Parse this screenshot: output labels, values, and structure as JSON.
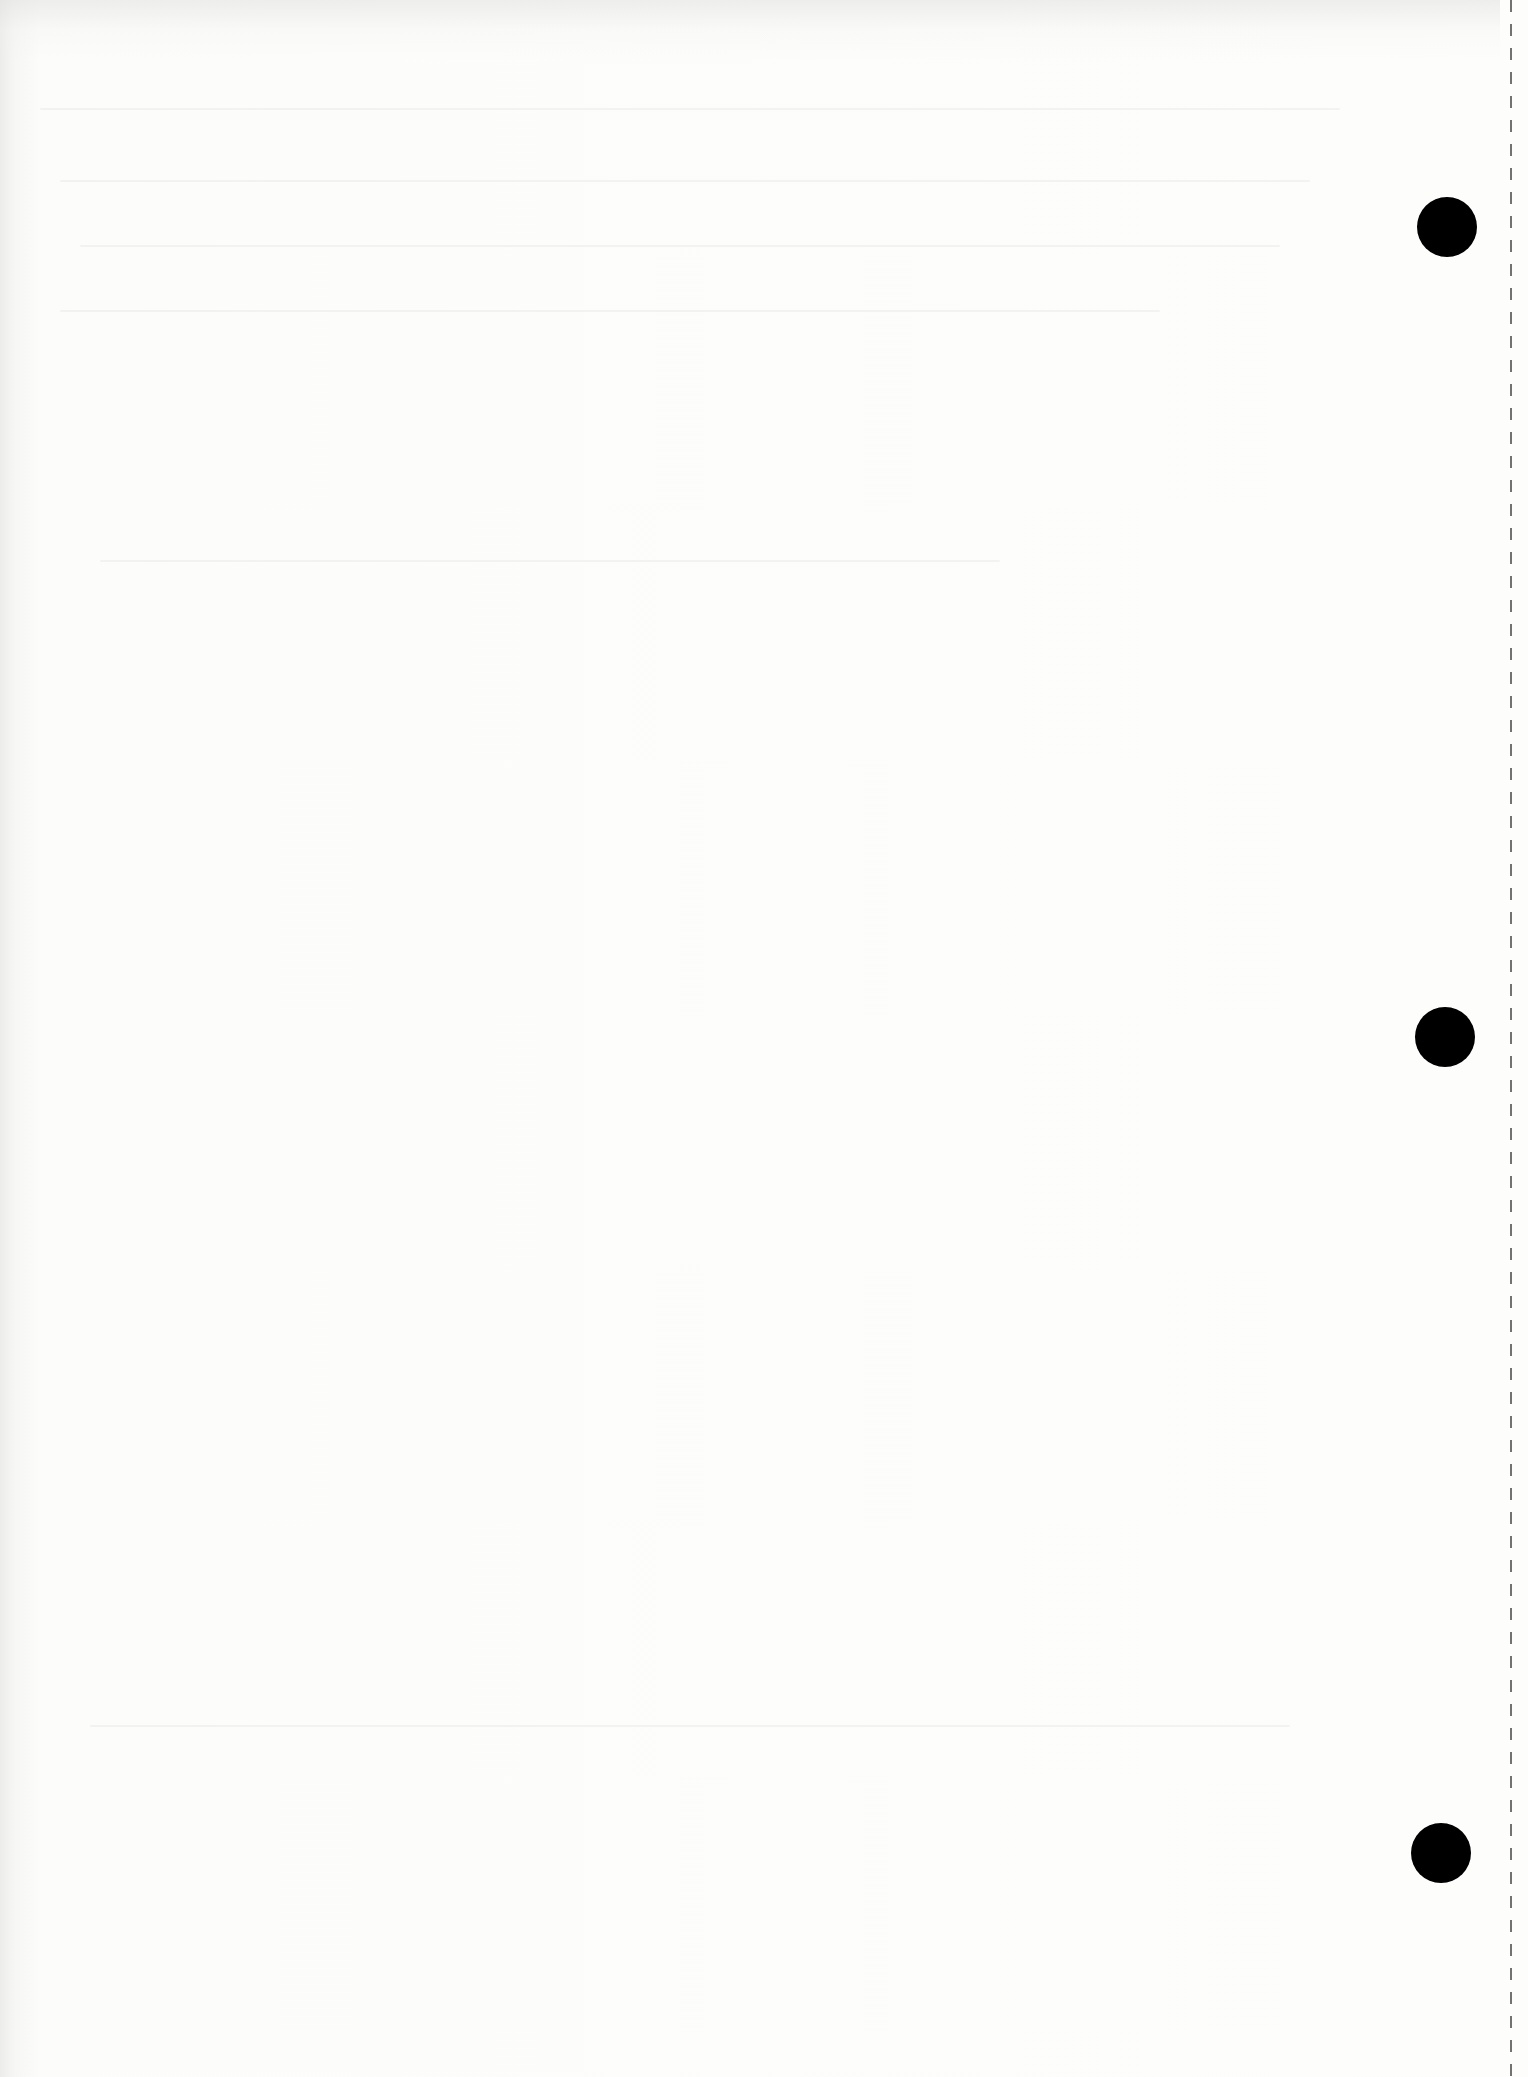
{
  "document": {
    "type": "blank scanned page",
    "text_content": "",
    "background_color": "#fdfdfc",
    "hole_color": "#000000",
    "perforation_color": "#444444",
    "punch_holes": [
      {
        "cx": 1447,
        "cy": 227,
        "r": 30
      },
      {
        "cx": 1445,
        "cy": 1037,
        "r": 30
      },
      {
        "cx": 1441,
        "cy": 1853,
        "r": 30
      }
    ],
    "perforation_line": {
      "x": 1510,
      "style": "dashed"
    }
  }
}
